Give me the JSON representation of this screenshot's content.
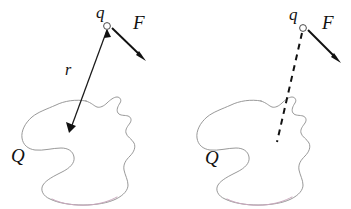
{
  "figure": {
    "domain_type": "physics-diagram",
    "width": 351,
    "height": 209,
    "background_color": "#ffffff"
  },
  "colors": {
    "blob_stroke": "#8d8d8d",
    "blob_tint_stroke": "#c9a8bd",
    "vector_stroke": "#1a1a1a",
    "label_text": "#111111",
    "charge_marker_fill": "#ffffff",
    "charge_marker_stroke": "#4a4a4a"
  },
  "panels": [
    {
      "id": "left-panel",
      "name": "distance-vector-panel",
      "connector_style": "solid-arrow",
      "labels": {
        "charge": "q",
        "force": "F",
        "distance": "r",
        "body": "Q"
      },
      "label_positions": {
        "charge": {
          "x": 96,
          "y": 4
        },
        "force": {
          "x": 133,
          "y": 13
        },
        "distance": {
          "x": 65,
          "y": 62
        },
        "body": {
          "x": 11,
          "y": 146
        }
      },
      "geometry": {
        "charge_marker": {
          "cx": 107,
          "cy": 26,
          "r": 3.4
        },
        "connector": {
          "x1": 107,
          "y1": 29,
          "x2": 70,
          "y2": 130
        },
        "connector_arrow_at": "both-ends",
        "force_vector": {
          "x1": 112,
          "y1": 28,
          "x2": 145,
          "y2": 60
        }
      }
    },
    {
      "id": "right-panel",
      "name": "field-line-panel",
      "connector_style": "dashed-line",
      "labels": {
        "charge": "q",
        "force": "F",
        "body": "Q"
      },
      "label_positions": {
        "charge": {
          "x": 289,
          "y": 6
        },
        "force": {
          "x": 322,
          "y": 13
        },
        "body": {
          "x": 205,
          "y": 148
        }
      },
      "geometry": {
        "charge_marker": {
          "cx": 303,
          "cy": 28,
          "r": 3.4
        },
        "connector": {
          "x1": 301,
          "y1": 32,
          "x2": 276,
          "y2": 142
        },
        "connector_arrow_at": "none",
        "force_vector": {
          "x1": 308,
          "y1": 30,
          "x2": 340,
          "y2": 62
        }
      }
    }
  ],
  "shapes": {
    "blob_label_name": "charged-body-outline",
    "blob_left_offset_x": 0,
    "blob_right_offset_x": 175,
    "blob_path": "M 86 101 C 76 99 64 101 56 105 C 47 109 38 112 32 117 C 25 123 21 131 22 138 C 23 145 28 149 35 150 C 43 151 53 148 61 148 C 68 148 73 151 74 157 C 75 163 70 168 62 172 C 54 176 46 180 43 185 C 40 190 43 196 50 199 C 58 203 70 205 83 205 C 96 205 108 203 116 199 C 124 195 128 190 128 185 C 128 180 125 175 124 170 C 123 164 126 160 130 156 C 134 152 136 147 134 143 C 132 139 127 137 126 133 C 125 129 128 126 130 123 C 132 120 131 117 128 116 C 125 115 120 116 118 113 C 116 110 118 106 120 103 C 122 100 120 97 117 97 C 114 97 110 100 107 103 C 104 106 100 108 97 107 C 94 106 92 103 86 101 Z",
    "blob_tint_path": "M 52 199 C 62 204 76 206 89 205 C 100 204 110 201 117 197"
  }
}
